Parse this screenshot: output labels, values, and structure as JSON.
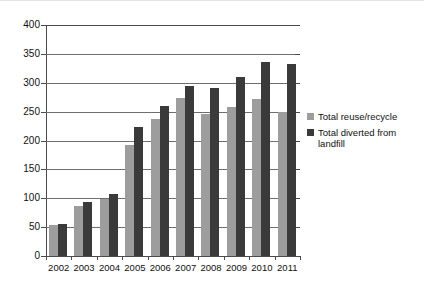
{
  "chart_data": {
    "type": "bar",
    "title": "",
    "subtitle": "",
    "xlabel": "",
    "ylabel": "",
    "categories": [
      "2002",
      "2003",
      "2004",
      "2005",
      "2006",
      "2007",
      "2008",
      "2009",
      "2010",
      "2011"
    ],
    "series": [
      {
        "name": "Total reuse/recycle",
        "color": "#9d9d9d",
        "values": [
          53,
          87,
          99,
          193,
          238,
          274,
          246,
          258,
          272,
          249
        ]
      },
      {
        "name": "Total diverted from landfill",
        "color": "#3a3a3a",
        "values": [
          56,
          93,
          107,
          224,
          260,
          295,
          291,
          310,
          336,
          332
        ]
      }
    ],
    "ylim": [
      0,
      400
    ],
    "ytick_step": 50,
    "yticks": [
      "400",
      "350",
      "300",
      "250",
      "200",
      "150",
      "100",
      "50",
      "0"
    ],
    "grid": "horizontal",
    "legend_position": "right"
  },
  "legend": {
    "items": [
      {
        "label": "Total reuse/recycle"
      },
      {
        "label": "Total diverted from landfill"
      }
    ]
  }
}
